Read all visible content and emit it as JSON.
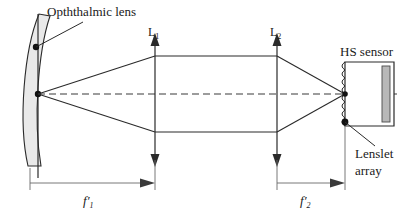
{
  "figure": {
    "type": "optical-ray-diagram",
    "width": 417,
    "height": 211,
    "background": "#ffffff"
  },
  "labels": {
    "ophthalmic_lens": "Opththalmic lens",
    "lens_1": "L",
    "lens_1_sub": "1",
    "lens_2": "L",
    "lens_2_sub": "2",
    "hs_sensor": "HS sensor",
    "lenslet_array_line1": "Lenslet",
    "lenslet_array_line2": "array",
    "focal_1": "f",
    "focal_1_prime": "′",
    "focal_1_sub": "1",
    "focal_2": "f",
    "focal_2_prime": "′",
    "focal_2_sub": "2"
  },
  "components": [
    {
      "id": "ophthalmic-lens",
      "kind": "meniscus-lens",
      "label": "Opththalmic lens",
      "x": 30,
      "fill": "#e9e9e9"
    },
    {
      "id": "lens-L1",
      "kind": "thin-lens",
      "label": "L1",
      "x": 155,
      "focal_label": "f'1"
    },
    {
      "id": "lens-L2",
      "kind": "thin-lens",
      "label": "L2",
      "x": 277,
      "focal_label": "f'2"
    },
    {
      "id": "lenslet-array",
      "kind": "lenslet-array",
      "label": "Lenslet array",
      "x": 345
    },
    {
      "id": "hs-sensor",
      "kind": "sensor-box",
      "label": "HS sensor",
      "x": 345
    },
    {
      "id": "detector",
      "kind": "detector-plane",
      "x": 385
    }
  ],
  "optical_axis": {
    "style": "dashed",
    "y": 94,
    "from_x": 38,
    "to_x": 400,
    "color": "#3a3a3a"
  },
  "dimensions": [
    {
      "id": "f-prime-1",
      "label": "f′1",
      "from_x": 30,
      "to_x": 155,
      "y": 183
    },
    {
      "id": "f-prime-2",
      "label": "f′2",
      "from_x": 277,
      "to_x": 345,
      "y": 183
    }
  ],
  "colors": {
    "ray": "#2a2a2a",
    "axis": "#3a3a3a",
    "lens_fill": "#e9e9e9",
    "detector_fill": "#b8b8b8",
    "dimension": "#6a6a6a",
    "text": "#1a1a1a"
  }
}
